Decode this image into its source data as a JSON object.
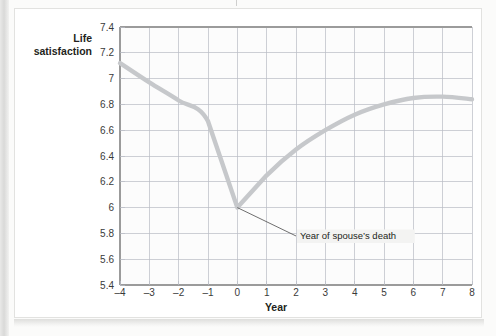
{
  "figure": {
    "y_axis_title_line1": "Life",
    "y_axis_title_line2": "satisfaction",
    "x_axis_title": "Year",
    "annotation": "Year of spouse’s death"
  },
  "colors": {
    "line": "#c6c8cb",
    "grid": "#b9bcc4",
    "axis": "#9b9b9b",
    "text": "#231f20",
    "callout_bg": "#f3f3f2",
    "page_bg": "#fbfbfa",
    "card_bg": "#ffffff"
  },
  "chart_data": {
    "type": "line",
    "title": "",
    "subtitle": "",
    "xlabel": "Year",
    "ylabel": "Life satisfaction",
    "xlim": [
      -4,
      8
    ],
    "ylim": [
      5.4,
      7.4
    ],
    "xticks": [
      -4,
      -3,
      -2,
      -1,
      0,
      1,
      2,
      3,
      4,
      5,
      6,
      7,
      8
    ],
    "xtick_labels": [
      "–4",
      "–3",
      "–2",
      "–1",
      "0",
      "1",
      "2",
      "3",
      "4",
      "5",
      "6",
      "7",
      "8"
    ],
    "yticks": [
      5.4,
      5.6,
      5.8,
      6,
      6.2,
      6.4,
      6.6,
      6.8,
      7,
      7.2,
      7.4
    ],
    "ytick_labels": [
      "5.4",
      "5.6",
      "5.8",
      "6",
      "6.2",
      "6.4",
      "6.6",
      "6.8",
      "7",
      "7.2",
      "7.4"
    ],
    "grid": true,
    "legend": false,
    "series": [
      {
        "name": "Life satisfaction",
        "x": [
          -4,
          -3,
          -2,
          -1,
          0,
          1,
          2,
          3,
          4,
          5,
          6,
          7,
          8
        ],
        "values": [
          7.12,
          6.97,
          6.83,
          6.67,
          6.0,
          6.25,
          6.45,
          6.6,
          6.72,
          6.8,
          6.85,
          6.86,
          6.84
        ]
      }
    ],
    "annotations": [
      {
        "text": "Year of spouse’s death",
        "point_x": 0,
        "point_y": 6.0,
        "label_x": 2.0,
        "label_y": 5.78
      }
    ]
  }
}
